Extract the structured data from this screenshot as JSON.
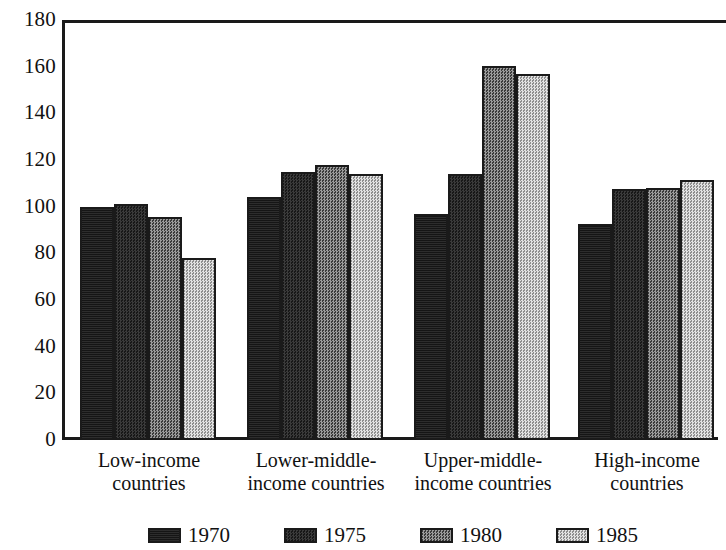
{
  "chart_data": {
    "type": "bar",
    "title": "",
    "subtitle": "",
    "xlabel": "",
    "ylabel": "",
    "ylim": [
      0,
      180
    ],
    "grid": false,
    "legend_position": "bottom",
    "y_ticks": [
      0,
      20,
      40,
      60,
      80,
      100,
      120,
      140,
      160,
      180
    ],
    "y_tick_labels": [
      "0",
      "20",
      "40",
      "60",
      "80",
      "100",
      "120",
      "140",
      "160",
      "180"
    ],
    "categories": [
      "Low-income countries",
      "Lower-middle-income countries",
      "Upper-middle-income countries",
      "High-income countries"
    ],
    "category_label_lines": [
      [
        "Low-income",
        "countries"
      ],
      [
        "Lower-middle-",
        "income countries"
      ],
      [
        "Upper-middle-",
        "income countries"
      ],
      [
        "High-income",
        "countries"
      ]
    ],
    "series": [
      {
        "name": "1970",
        "values": [
          100,
          104,
          97,
          92.5
        ],
        "color": "#151515",
        "pattern": "solid-black"
      },
      {
        "name": "1975",
        "values": [
          101,
          115,
          114,
          107.5
        ],
        "color": "#2b2b2b",
        "pattern": "dense-checker"
      },
      {
        "name": "1980",
        "values": [
          95.5,
          118,
          160.5,
          108
        ],
        "color": "#6e6e6e",
        "pattern": "medium-checker"
      },
      {
        "name": "1985",
        "values": [
          78,
          114,
          157,
          111.5
        ],
        "color": "#c4c4c4",
        "pattern": "light-checker"
      }
    ],
    "legend": [
      {
        "label": "1970",
        "swatch": "#151515"
      },
      {
        "label": "1975",
        "swatch": "#2b2b2b"
      },
      {
        "label": "1980",
        "swatch": "#6e6e6e"
      },
      {
        "label": "1985",
        "swatch": "#c4c4c4"
      }
    ],
    "axis_color": "#1a1a1a",
    "background_color": "#ffffff"
  },
  "layout": {
    "plot_left": 62,
    "plot_top": 20,
    "plot_bottom": 440,
    "plot_right": 718,
    "bar_width": 34,
    "group_starts": [
      80,
      247,
      414,
      578
    ],
    "legend_entry_lefts": [
      148,
      284,
      420,
      556
    ],
    "category_label_centers": [
      149,
      316,
      483,
      647
    ],
    "px_per_unit": 2.3333
  }
}
